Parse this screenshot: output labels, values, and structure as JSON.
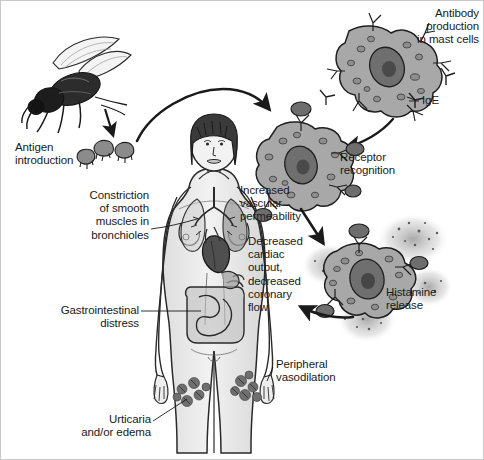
{
  "figure": {
    "background_color": "#ffffff",
    "border_color": "#c9c9c9",
    "ink_color": "#1a1a1a",
    "cell_fill": "#a8a8a8",
    "cell_fill_light": "#c4c4c4",
    "nucleus_fill": "#7a7a7a",
    "organ_fill": "#bdbdbd",
    "heart_fill": "#4f4f4f",
    "body_fill": "#e9e9e9",
    "granule_color": "#8d8d8d"
  },
  "labels": {
    "antigen_introduction": "Antigen\nintroduction",
    "antibody_production": "Antibody\nproduction\nin mast cells",
    "ige": "IgE",
    "receptor_recognition": "Receptor\nrecognition",
    "histamine_release": "Histamine\nrelease",
    "increased_vascular_permeability": "Increased\nvascular\npermeability",
    "decreased_cardiac_output": "Decreased\ncardiac\noutput,\ndecreased\ncoronary\nflow",
    "constriction_bronchioles": "Constriction\nof smooth\nmuscles in\nbronchioles",
    "gastrointestinal_distress": "Gastrointestinal\ndistress",
    "peripheral_vasodilation": "Peripheral\nvasodilation",
    "urticaria_edema": "Urticaria\nand/or edema"
  },
  "icons": {
    "insect": "bee-icon",
    "antigen": "antigen-particle-icon",
    "mast_cell": "mast-cell-icon",
    "ige_antibody": "ige-antibody-icon",
    "human_body": "human-figure-icon",
    "lungs": "lungs-icon",
    "heart": "heart-icon",
    "intestines": "intestines-icon",
    "hives": "urticaria-hives-icon",
    "arrow": "arrow-icon"
  }
}
